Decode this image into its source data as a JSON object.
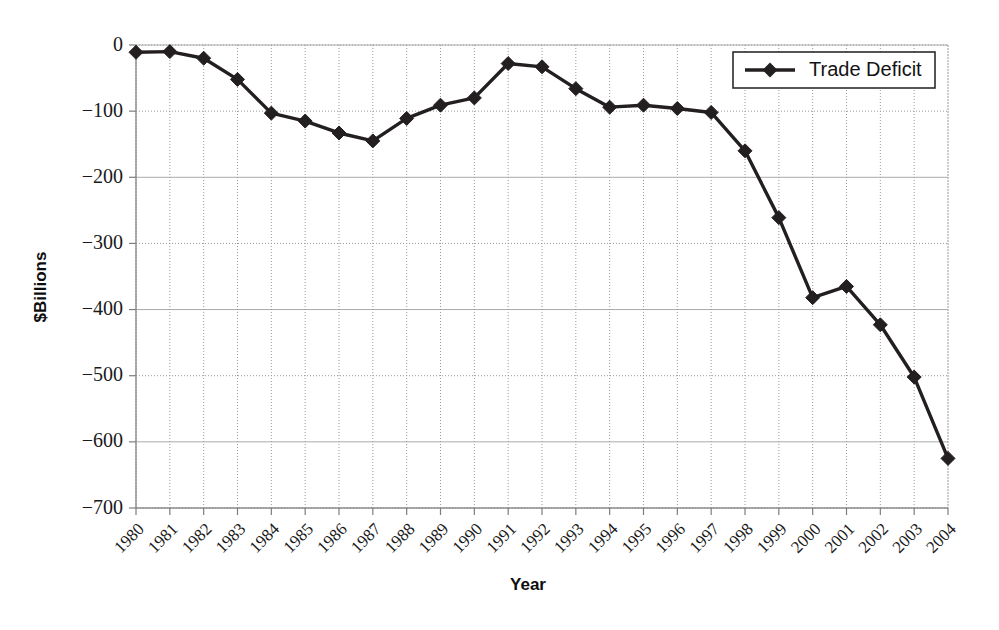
{
  "chart_data": {
    "type": "line",
    "title": "",
    "xlabel": "Year",
    "ylabel": "$Billions",
    "grid": true,
    "legend_position": "top-right",
    "xlim": [
      1980,
      2004
    ],
    "ylim": [
      -700,
      0
    ],
    "ytick_labels": [
      "0",
      "−100",
      "−200",
      "−300",
      "−400",
      "−500",
      "−600",
      "−700"
    ],
    "ytick_values": [
      0,
      -100,
      -200,
      -300,
      -400,
      -500,
      -600,
      -700
    ],
    "categories": [
      "1980",
      "1981",
      "1982",
      "1983",
      "1984",
      "1985",
      "1986",
      "1987",
      "1988",
      "1989",
      "1990",
      "1991",
      "1992",
      "1993",
      "1994",
      "1995",
      "1996",
      "1997",
      "1998",
      "1999",
      "2000",
      "2001",
      "2002",
      "2003",
      "2004"
    ],
    "series": [
      {
        "name": "Trade Deficit",
        "marker": "diamond",
        "color": "#231f20",
        "values": [
          -11,
          -10,
          -20,
          -52,
          -103,
          -115,
          -133,
          -145,
          -111,
          -91,
          -80,
          -28,
          -33,
          -66,
          -94,
          -91,
          -96,
          -102,
          -160,
          -261,
          -382,
          -365,
          -423,
          -502,
          -625
        ]
      }
    ]
  },
  "legend": {
    "entries": [
      {
        "label": "Trade Deficit",
        "marker": "diamond-marker"
      }
    ]
  },
  "axes": {
    "x_title": "Year",
    "y_title": "$Billions"
  }
}
